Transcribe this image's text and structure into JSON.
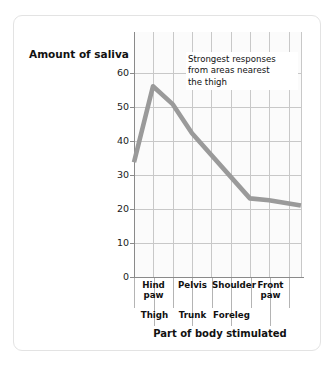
{
  "figure": {
    "background_color": "#ffffff",
    "border_color": "#e3e3e3",
    "plot_background_color": "#fbfbfb",
    "gridline_color": "#c8c8c8",
    "axis_color": "#8a8a8a",
    "line_color": "#9a9a9a"
  },
  "chart_data": {
    "type": "line",
    "title": "",
    "subtitle": "",
    "xlabel": "Part of body stimulated",
    "ylabel": "Amount of saliva",
    "categories": [
      "Hind paw",
      "Thigh",
      "Pelvis",
      "Trunk",
      "Shoulder",
      "Foreleg",
      "Front paw"
    ],
    "values": [
      32,
      53,
      48,
      40,
      22,
      21.5,
      20
    ],
    "series": [
      {
        "name": "Amount of saliva",
        "values": [
          32,
          53,
          48,
          40,
          22,
          21.5,
          20
        ]
      }
    ],
    "ylim": [
      0,
      68
    ],
    "yticks": [
      0,
      10,
      20,
      30,
      40,
      50,
      60
    ],
    "ytick_labels": [
      "0",
      "10",
      "20",
      "30",
      "40",
      "50",
      "60"
    ],
    "grid": true,
    "legend": "none",
    "annotations": [
      {
        "text": "Strongest responses from areas nearest the thigh",
        "line1": "Strongest responses",
        "line2": "from areas nearest",
        "line3": "the thigh"
      }
    ]
  },
  "axis": {
    "y_title": "Amount of saliva",
    "x_title": "Part of body stimulated",
    "y_ticks": [
      "60",
      "50",
      "40",
      "30",
      "20",
      "10",
      "0"
    ]
  },
  "x_labels": {
    "row1": [
      {
        "line1": "Hind",
        "line2": "paw"
      },
      {
        "line1": "Pelvis",
        "line2": ""
      },
      {
        "line1": "Shoulder",
        "line2": ""
      },
      {
        "line1": "Front",
        "line2": "paw"
      }
    ],
    "row2": [
      {
        "line1": "Thigh"
      },
      {
        "line1": "Trunk"
      },
      {
        "line1": "Foreleg"
      }
    ]
  },
  "annotation": {
    "line1": "Strongest responses",
    "line2": "from areas nearest",
    "line3": "the thigh"
  }
}
